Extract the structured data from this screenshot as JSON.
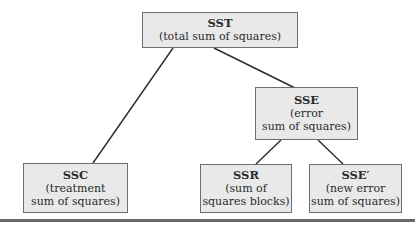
{
  "diagram": {
    "type": "tree",
    "nodes": [
      {
        "id": "sst",
        "title": "SST",
        "lines": [
          "(total sum of squares)"
        ]
      },
      {
        "id": "ssc",
        "title": "SSC",
        "lines": [
          "(treatment",
          "sum of squares)"
        ]
      },
      {
        "id": "sse",
        "title": "SSE",
        "lines": [
          "(error",
          "sum of squares)"
        ]
      },
      {
        "id": "ssr",
        "title": "SSR",
        "lines": [
          "(sum of",
          "squares blocks)"
        ]
      },
      {
        "id": "sse_prime",
        "title": "SSE′",
        "lines": [
          "(new error",
          "sum of squares)"
        ]
      }
    ],
    "edges": [
      {
        "from": "sst",
        "to": "ssc"
      },
      {
        "from": "sst",
        "to": "sse"
      },
      {
        "from": "sse",
        "to": "ssr"
      },
      {
        "from": "sse",
        "to": "sse_prime"
      }
    ]
  }
}
